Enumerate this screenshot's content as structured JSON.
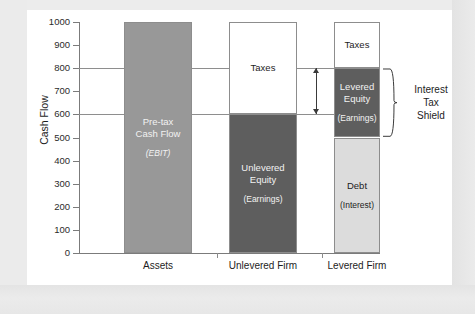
{
  "chart_data": {
    "type": "bar",
    "title": "",
    "xlabel": "",
    "ylabel": "Cash Flow",
    "ylim": [
      0,
      1000
    ],
    "ytick_step": 100,
    "yticks": [
      "1000",
      "900",
      "800",
      "700",
      "600",
      "500",
      "400",
      "300",
      "200",
      "100",
      "0"
    ],
    "grid": "horizontal gridlines at 600 and 800 only",
    "legend_position": "none",
    "categories": [
      "Assets",
      "Unlevered Firm",
      "Levered Firm"
    ],
    "stacks": [
      {
        "category": "Assets",
        "segments": [
          {
            "label": "Pre-tax\nCash Flow",
            "sub": "(EBIT)",
            "from": 0,
            "to": 1000,
            "value": 1000,
            "fill": "#989898",
            "text": "light",
            "sub_italic": true
          }
        ]
      },
      {
        "category": "Unlevered Firm",
        "segments": [
          {
            "label": "Taxes",
            "sub": "",
            "from": 600,
            "to": 1000,
            "value": 400,
            "fill": "#ffffff",
            "text": "dark",
            "sub_italic": false
          },
          {
            "label": "Unlevered\nEquity",
            "sub": "(Earnings)",
            "from": 0,
            "to": 600,
            "value": 600,
            "fill": "#5e5e5e",
            "text": "light",
            "sub_italic": false
          }
        ]
      },
      {
        "category": "Levered Firm",
        "segments": [
          {
            "label": "Taxes",
            "sub": "",
            "from": 800,
            "to": 1000,
            "value": 200,
            "fill": "#ffffff",
            "text": "dark",
            "sub_italic": false
          },
          {
            "label": "Levered\nEquity",
            "sub": "(Earnings)",
            "from": 500,
            "to": 800,
            "value": 300,
            "fill": "#5e5e5e",
            "text": "light",
            "sub_italic": false
          },
          {
            "label": "Debt",
            "sub": "(Interest)",
            "from": 0,
            "to": 500,
            "value": 500,
            "fill": "#dcdcdc",
            "text": "dark",
            "sub_italic": false
          }
        ]
      }
    ],
    "gridlines": [
      600,
      800
    ],
    "annotations": [
      {
        "name": "interest-tax-shield",
        "label": "Interest\nTax\nShield",
        "brace_from": 500,
        "brace_to": 800
      },
      {
        "name": "tax-saving-arrow",
        "label": "",
        "arrow_from": 600,
        "arrow_to": 800,
        "kind": "double-headed-vertical-arrow"
      }
    ],
    "colors": {
      "pretax_cash_flow": "#989898",
      "equity": "#5e5e5e",
      "debt": "#dcdcdc",
      "taxes": "#ffffff",
      "axis": "#7b7b7b",
      "gridline": "#8e8e8e",
      "panel_background": "#ffffff",
      "page_background": "#e9e9e9"
    }
  }
}
